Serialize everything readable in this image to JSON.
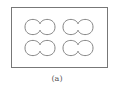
{
  "figure": {
    "caption": "(a)",
    "frame": {
      "x": 11.5,
      "y": 7.5,
      "w": 96,
      "h": 60,
      "stroke": "#777777"
    },
    "shape_stroke": "#777777",
    "shapes": [
      {
        "cx": 40,
        "cy": 27
      },
      {
        "cx": 78,
        "cy": 27
      },
      {
        "cx": 40,
        "cy": 48
      },
      {
        "cx": 78,
        "cy": 48
      }
    ]
  }
}
